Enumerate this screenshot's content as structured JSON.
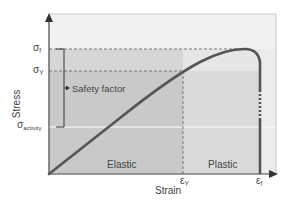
{
  "diagram": {
    "type": "stress-strain",
    "axes": {
      "x_label": "Strain",
      "y_label": "Stress"
    },
    "stress_levels": {
      "sigma_f": {
        "symbol": "σ",
        "subscript": "f"
      },
      "sigma_y": {
        "symbol": "σ",
        "subscript": "Y"
      },
      "sigma_activity": {
        "symbol": "σ",
        "subscript": "activity"
      }
    },
    "strain_levels": {
      "eps_y": {
        "symbol": "ε",
        "subscript": "Y"
      },
      "eps_f": {
        "symbol": "ε",
        "subscript": "f"
      }
    },
    "regions": {
      "elastic": "Elastic",
      "plastic": "Plastic"
    },
    "annotations": {
      "safety_factor": "Safety factor"
    },
    "colors": {
      "elastic_fill": "#c9c9c9",
      "plastic_fill": "#dcdcdc",
      "upper_fill": "#e8e8e8",
      "top_fill": "#f1f1f1",
      "curve": "#555555",
      "dashed": "#777777",
      "text": "#444444"
    }
  }
}
